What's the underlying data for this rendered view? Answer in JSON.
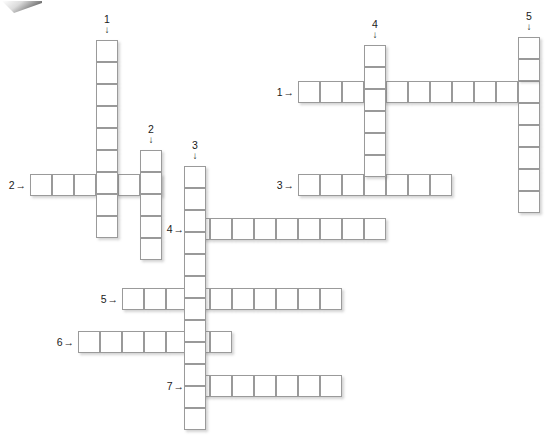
{
  "puzzle": {
    "type": "crossword-grid",
    "title": "",
    "cell_size": 22,
    "width": 554,
    "height": 436,
    "colors": {
      "cell_border": "#9a9a9a",
      "cell_fill": "#ffffff",
      "label_text": "#1a1a1a",
      "background": "#ffffff"
    },
    "arrows": {
      "across": "→",
      "down": "↓"
    },
    "entries": [
      {
        "id": "a-left-2",
        "number": "2",
        "direction": "across",
        "length": 6,
        "x": 30,
        "y": 174
      },
      {
        "id": "a-left-4",
        "number": "4",
        "direction": "across",
        "length": 9,
        "x": 188,
        "y": 218
      },
      {
        "id": "a-left-5",
        "number": "5",
        "direction": "across",
        "length": 10,
        "x": 122,
        "y": 288
      },
      {
        "id": "a-left-6",
        "number": "6",
        "direction": "across",
        "length": 7,
        "x": 78,
        "y": 331
      },
      {
        "id": "a-left-7",
        "number": "7",
        "direction": "across",
        "length": 7,
        "x": 188,
        "y": 375
      },
      {
        "id": "a-right-1",
        "number": "1",
        "direction": "across",
        "length": 11,
        "x": 298,
        "y": 81
      },
      {
        "id": "a-right-3",
        "number": "3",
        "direction": "across",
        "length": 7,
        "x": 298,
        "y": 174
      },
      {
        "id": "d-left-1",
        "number": "1",
        "direction": "down",
        "length": 9,
        "x": 96,
        "y": 40
      },
      {
        "id": "d-left-2",
        "number": "2",
        "direction": "down",
        "length": 5,
        "x": 140,
        "y": 150
      },
      {
        "id": "d-left-3",
        "number": "3",
        "direction": "down",
        "length": 12,
        "x": 184,
        "y": 166
      },
      {
        "id": "d-right-4",
        "number": "4",
        "direction": "down",
        "length": 6,
        "x": 364,
        "y": 45
      },
      {
        "id": "d-right-5",
        "number": "5",
        "direction": "down",
        "length": 8,
        "x": 518,
        "y": 37
      }
    ],
    "labels": {
      "across": [
        {
          "key": "left-2",
          "text": "2",
          "x": 28,
          "y": 185
        },
        {
          "key": "left-4",
          "text": "4",
          "x": 186,
          "y": 229
        },
        {
          "key": "left-5",
          "text": "5",
          "x": 120,
          "y": 299
        },
        {
          "key": "left-6",
          "text": "6",
          "x": 76,
          "y": 342
        },
        {
          "key": "left-7",
          "text": "7",
          "x": 186,
          "y": 386
        },
        {
          "key": "right-1",
          "text": "1",
          "x": 296,
          "y": 92
        },
        {
          "key": "right-3",
          "text": "3",
          "x": 296,
          "y": 185
        }
      ],
      "down": [
        {
          "key": "left-1",
          "text": "1",
          "x": 107,
          "y": 14
        },
        {
          "key": "left-2",
          "text": "2",
          "x": 151,
          "y": 124
        },
        {
          "key": "left-3",
          "text": "3",
          "x": 195,
          "y": 140
        },
        {
          "key": "right-4",
          "text": "4",
          "x": 375,
          "y": 19
        },
        {
          "key": "right-5",
          "text": "5",
          "x": 529,
          "y": 11
        }
      ]
    }
  }
}
